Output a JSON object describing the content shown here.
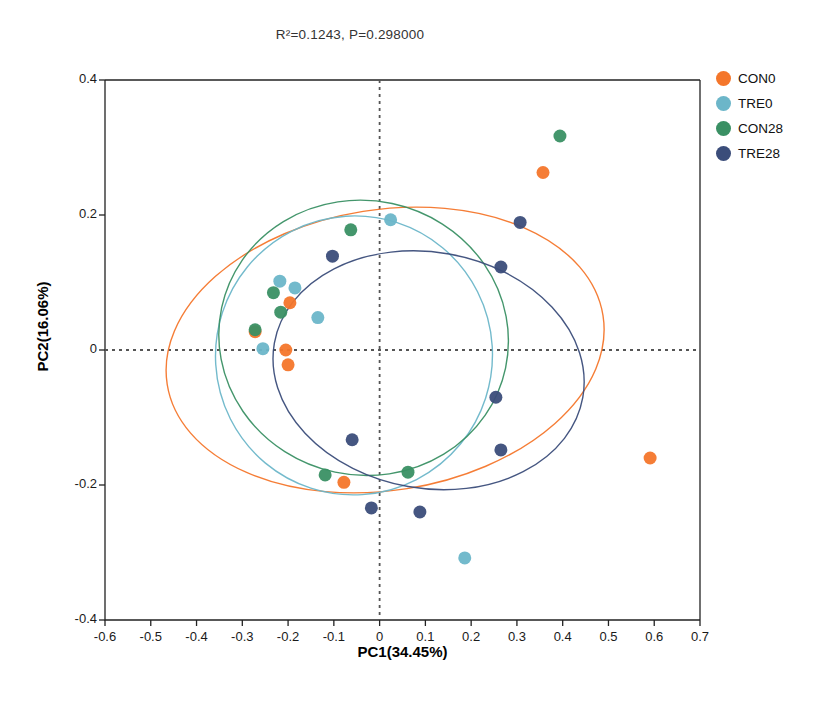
{
  "title": "R²=0.1243, P=0.298000",
  "axes": {
    "x_label": "PC1(34.45%)",
    "y_label": "PC2(16.06%)",
    "x_ticks": [
      "-0.6",
      "-0.5",
      "-0.4",
      "-0.3",
      "-0.2",
      "-0.1",
      "0",
      "0.1",
      "0.2",
      "0.3",
      "0.4",
      "0.5",
      "0.6",
      "0.7"
    ],
    "y_ticks": [
      "0.4",
      "0.2",
      "0",
      "-0.2",
      "-0.4"
    ]
  },
  "legend": {
    "items": [
      {
        "label": "CON0",
        "color": "#F4762B"
      },
      {
        "label": "TRE0",
        "color": "#6CB6C9"
      },
      {
        "label": "CON28",
        "color": "#3A9064"
      },
      {
        "label": "TRE28",
        "color": "#3B4D7A"
      }
    ]
  },
  "chart_data": {
    "type": "scatter",
    "title": "R²=0.1243, P=0.298000",
    "xlabel": "PC1(34.45%)",
    "ylabel": "PC2(16.06%)",
    "xlim": [
      -0.6,
      0.7
    ],
    "ylim": [
      -0.4,
      0.4
    ],
    "xticks": [
      -0.6,
      -0.5,
      -0.4,
      -0.3,
      -0.2,
      -0.1,
      0,
      0.1,
      0.2,
      0.3,
      0.4,
      0.5,
      0.6,
      0.7
    ],
    "yticks": [
      -0.4,
      -0.2,
      0,
      0.2,
      0.4
    ],
    "grid": false,
    "reference_lines": {
      "x": 0,
      "y": 0,
      "style": "dotted",
      "color": "#555555"
    },
    "legend_position": "right",
    "marker_size_px": 13,
    "series": [
      {
        "name": "CON0",
        "color": "#F4762B",
        "points": [
          [
            0.357,
            0.263
          ],
          [
            0.591,
            -0.16
          ],
          [
            -0.196,
            0.07
          ],
          [
            -0.205,
            0.0
          ],
          [
            -0.2,
            -0.022
          ],
          [
            -0.078,
            -0.196
          ],
          [
            -0.272,
            0.027
          ]
        ],
        "ellipse": {
          "cx": 0.012,
          "cy": 0.0,
          "rx": 0.482,
          "ry": 0.208,
          "angle_deg": -9
        }
      },
      {
        "name": "TRE0",
        "color": "#6CB6C9",
        "points": [
          [
            -0.218,
            0.102
          ],
          [
            -0.185,
            0.092
          ],
          [
            -0.255,
            0.002
          ],
          [
            -0.135,
            0.048
          ],
          [
            0.024,
            0.193
          ],
          [
            0.186,
            -0.308
          ]
        ],
        "ellipse": {
          "cx": -0.056,
          "cy": -0.008,
          "rx": 0.305,
          "ry": 0.205,
          "angle_deg": -72
        }
      },
      {
        "name": "CON28",
        "color": "#3A9064",
        "points": [
          [
            0.394,
            0.317
          ],
          [
            -0.063,
            0.178
          ],
          [
            -0.232,
            0.085
          ],
          [
            -0.216,
            0.056
          ],
          [
            -0.272,
            0.03
          ],
          [
            -0.119,
            -0.185
          ],
          [
            0.062,
            -0.181
          ]
        ],
        "ellipse": {
          "cx": -0.035,
          "cy": 0.018,
          "rx": 0.3,
          "ry": 0.215,
          "angle_deg": -78
        }
      },
      {
        "name": "TRE28",
        "color": "#3B4D7A",
        "points": [
          [
            0.307,
            0.189
          ],
          [
            0.265,
            0.123
          ],
          [
            -0.103,
            0.139
          ],
          [
            0.254,
            -0.07
          ],
          [
            0.265,
            -0.148
          ],
          [
            -0.06,
            -0.133
          ],
          [
            -0.018,
            -0.234
          ],
          [
            0.088,
            -0.24
          ]
        ],
        "ellipse": {
          "cx": 0.107,
          "cy": -0.03,
          "rx": 0.258,
          "ry": 0.232,
          "angle_deg": -80
        }
      }
    ]
  }
}
